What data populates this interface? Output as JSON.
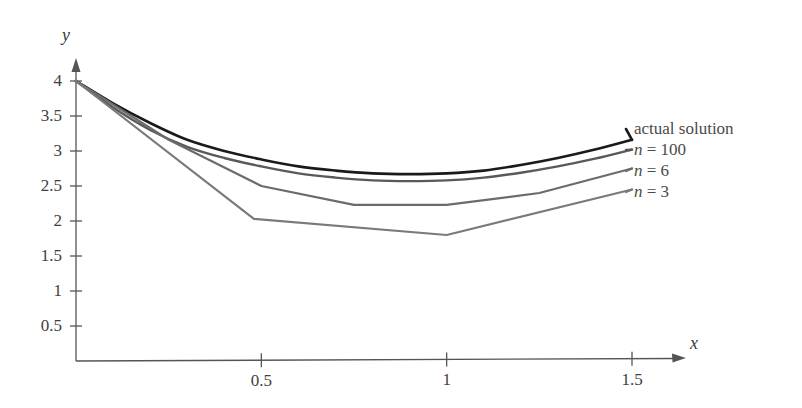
{
  "chart_data": {
    "type": "line",
    "title": "",
    "xlabel": "x",
    "ylabel": "y",
    "xlim": [
      0,
      1.62
    ],
    "ylim": [
      0,
      4.25
    ],
    "grid": false,
    "legend_position": "right",
    "x_ticks": [
      {
        "value": 0.5,
        "label": "0.5"
      },
      {
        "value": 1.0,
        "label": "1"
      },
      {
        "value": 1.5,
        "label": "1.5"
      }
    ],
    "y_ticks": [
      {
        "value": 0.5,
        "label": "0.5"
      },
      {
        "value": 1.0,
        "label": "1"
      },
      {
        "value": 1.5,
        "label": "1.5"
      },
      {
        "value": 2.0,
        "label": "2"
      },
      {
        "value": 2.5,
        "label": "2.5"
      },
      {
        "value": 3.0,
        "label": "3"
      },
      {
        "value": 3.5,
        "label": "3.5"
      },
      {
        "value": 4.0,
        "label": "4"
      }
    ],
    "series": [
      {
        "name": "actual solution",
        "label": "actual solution",
        "color": "#1a1a1a",
        "width": 2.6,
        "smooth": true,
        "x": [
          0,
          0.1,
          0.2,
          0.3,
          0.4,
          0.5,
          0.6,
          0.7,
          0.8,
          0.9,
          1.0,
          1.1,
          1.2,
          1.3,
          1.4,
          1.5
        ],
        "y": [
          4.0,
          3.68,
          3.4,
          3.16,
          3.0,
          2.88,
          2.78,
          2.72,
          2.68,
          2.67,
          2.68,
          2.72,
          2.8,
          2.9,
          3.02,
          3.16
        ]
      },
      {
        "name": "n = 100",
        "label": "n = 100",
        "color": "#595959",
        "width": 2.4,
        "smooth": true,
        "x": [
          0,
          0.1,
          0.2,
          0.3,
          0.4,
          0.5,
          0.6,
          0.7,
          0.8,
          0.9,
          1.0,
          1.1,
          1.2,
          1.3,
          1.4,
          1.5
        ],
        "y": [
          4.0,
          3.62,
          3.3,
          3.06,
          2.9,
          2.78,
          2.68,
          2.62,
          2.58,
          2.57,
          2.58,
          2.62,
          2.69,
          2.78,
          2.89,
          3.02
        ]
      },
      {
        "name": "n = 6",
        "label": "n = 6",
        "color": "#6b6b6b",
        "width": 2.2,
        "smooth": false,
        "x": [
          0,
          0.25,
          0.5,
          0.75,
          1.0,
          1.25,
          1.5
        ],
        "y": [
          4.0,
          3.16,
          2.5,
          2.23,
          2.23,
          2.4,
          2.75
        ]
      },
      {
        "name": "n = 3",
        "label": "n = 3",
        "color": "#7a7a7a",
        "width": 2.2,
        "smooth": false,
        "x": [
          0,
          0.48,
          1.0,
          1.5
        ],
        "y": [
          4.0,
          2.03,
          1.8,
          2.45
        ]
      }
    ],
    "legend_entries": [
      {
        "label": "actual solution",
        "italic_var": "",
        "rest": ""
      },
      {
        "label": "n = 100",
        "italic_var": "n",
        "rest": " = 100"
      },
      {
        "label": "n = 6",
        "italic_var": "n",
        "rest": " = 6"
      },
      {
        "label": "n = 3",
        "italic_var": "n",
        "rest": " = 3"
      }
    ],
    "axis_color": "#555555",
    "text_color": "#404040"
  }
}
